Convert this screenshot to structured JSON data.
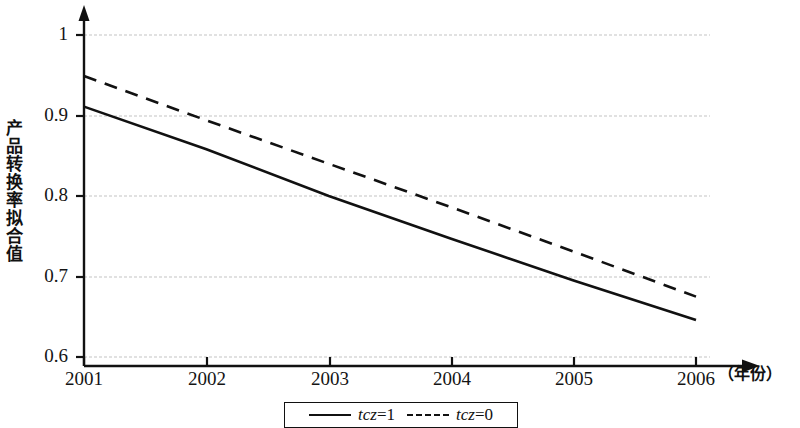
{
  "chart_data": {
    "type": "line",
    "title": "",
    "xlabel": "（年份）",
    "ylabel": "产品转换率拟合值",
    "x": [
      2001,
      2002,
      2003,
      2004,
      2005,
      2006
    ],
    "xticklabels": [
      "2001",
      "2002",
      "2003",
      "2004",
      "2005",
      "2006"
    ],
    "yticklabels": [
      "1",
      "0.9",
      "0.8",
      "0.7",
      "0.6"
    ],
    "yticks": [
      1,
      0.9,
      0.8,
      0.7,
      0.6
    ],
    "xlim": [
      2001,
      2006
    ],
    "ylim": [
      0.6,
      1.0
    ],
    "grid": true,
    "grid_axis": "y",
    "grid_color": "#d8d8d8",
    "legend_position": "bottom-center",
    "line_color": "#111111",
    "series": [
      {
        "name": "tcz=1",
        "style": "solid",
        "values": [
          0.911,
          0.858,
          0.8,
          0.747,
          0.695,
          0.646
        ]
      },
      {
        "name": "tcz=0",
        "style": "dashed",
        "values": [
          0.949,
          0.894,
          0.84,
          0.786,
          0.731,
          0.675
        ]
      }
    ]
  },
  "axis": {
    "y_label": "产品转换率拟合值",
    "x_label": "（年份）"
  },
  "legend": {
    "items": [
      {
        "label_italic": "tcz",
        "label_rest": "=1",
        "style": "solid"
      },
      {
        "label_italic": "tcz",
        "label_rest": "=0",
        "style": "dashed"
      }
    ]
  }
}
